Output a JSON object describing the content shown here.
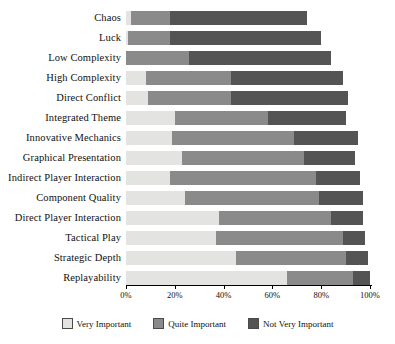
{
  "chart_data": {
    "type": "bar",
    "orientation": "horizontal",
    "stacked": true,
    "stack_mode": "percent",
    "title": "",
    "subtitle": "",
    "xlabel": "",
    "ylabel": "",
    "xlim": [
      0,
      100
    ],
    "grid": false,
    "legend_position": "bottom",
    "tick_labels": [
      "0%",
      "20%",
      "40%",
      "60%",
      "80%",
      "100%"
    ],
    "tick_values": [
      0,
      20,
      40,
      60,
      80,
      100
    ],
    "categories": [
      "Chaos",
      "Luck",
      "Low Complexity",
      "High Complexity",
      "Direct Conflict",
      "Integrated Theme",
      "Innovative Mechanics",
      "Graphical Presentation",
      "Indirect Player Interaction",
      "Component Quality",
      "Direct Player Interaction",
      "Tactical Play",
      "Strategic Depth",
      "Replayability"
    ],
    "series": [
      {
        "name": "Very Important",
        "color": "#e3e3e1",
        "values": [
          2,
          1,
          0,
          8,
          9,
          20,
          19,
          23,
          18,
          24,
          38,
          37,
          45,
          66
        ]
      },
      {
        "name": "Quite Important",
        "color": "#8a8a8a",
        "values": [
          16,
          17,
          26,
          35,
          34,
          38,
          50,
          50,
          60,
          55,
          46,
          52,
          45,
          27
        ]
      },
      {
        "name": "Not Very Important",
        "color": "#545454",
        "values": [
          56,
          62,
          58,
          46,
          48,
          32,
          26,
          21,
          18,
          18,
          13,
          9,
          9,
          7
        ]
      }
    ]
  },
  "legend": {
    "items": [
      {
        "label": "Very Important",
        "color": "#e3e3e1",
        "swatch_name": "legend-swatch-very-important"
      },
      {
        "label": "Quite Important",
        "color": "#8a8a8a",
        "swatch_name": "legend-swatch-quite-important"
      },
      {
        "label": "Not Very Important",
        "color": "#545454",
        "swatch_name": "legend-swatch-not-very-important"
      }
    ]
  }
}
